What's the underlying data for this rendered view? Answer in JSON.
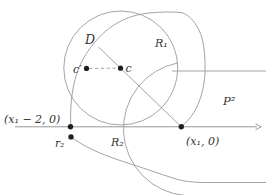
{
  "figure": {
    "width": 276,
    "height": 195,
    "colors": {
      "background": "#ffffff",
      "curve_stroke": "#9a9a9a",
      "axis_stroke": "#8c8c8c",
      "dot_fill": "#1f1f1f",
      "label_color": "#333333"
    },
    "axis": {
      "name": "real-axis",
      "x1": 15,
      "y": 126.8,
      "x2": 257,
      "arrow": "M255.5,123.9 L261.2,126.8 L255.5,129.8"
    },
    "circles": [
      {
        "name": "disk-D-boundary",
        "cx": 120.8,
        "cy": 68,
        "r": 57
      }
    ],
    "paths": [
      {
        "name": "outer-oval-R1-boundary",
        "d": "M70.8,126 C70,108 71.5,92 76,76 C81,59.5 90.5,45.5 102.5,34 C115,22 131,14.8 149,13 C160,11.9 172,11.6 182,12.6 C191.5,16 198.8,26.5 202.3,39 C204.6,48.5 205.3,60 205,71.5 C204.6,86 200.8,101 194.3,111.8 C190,118.6 186,122.8 181.3,126.8"
      },
      {
        "name": "circle-through-axis-arc",
        "d": "M177.8,62.9 A67,67 0 0 0 185.5,195.5"
      },
      {
        "name": "P2-lower-boundary",
        "d": "M71,136.9 C84,146.5 99,153.5 120,160.5 C142,167.5 160,174 176,179 C188,182.3 197,182.5 210,182.5 L266,182.5"
      }
    ],
    "lines": [
      {
        "name": "radius-segment-to-x1",
        "x1": 98.5,
        "y1": 47,
        "x2": 181.3,
        "y2": 126.8,
        "dashed": false
      },
      {
        "name": "P2-upper-boundary-line",
        "x1": 172,
        "y1": 71,
        "x2": 266,
        "y2": 71,
        "dashed": false
      },
      {
        "name": "c-cprime-dashed-segment",
        "x1": 89.3,
        "y1": 68.4,
        "x2": 117.8,
        "y2": 68.2,
        "dashed": true
      }
    ],
    "points": [
      {
        "name": "point-x1-minus-2",
        "x": 70.5,
        "y": 126.8,
        "r": 2.7
      },
      {
        "name": "point-x1",
        "x": 181.3,
        "y": 126.8,
        "r": 2.7
      },
      {
        "name": "point-r2",
        "x": 71,
        "y": 136.9,
        "r": 2.7
      },
      {
        "name": "point-c",
        "x": 120.5,
        "y": 68.2,
        "r": 2.6
      },
      {
        "name": "point-c-prime",
        "x": 86.5,
        "y": 68.4,
        "r": 2.6
      }
    ],
    "labels": [
      {
        "name": "label-disk-D",
        "text": "D",
        "x": 85,
        "y": 43.5,
        "size": 12.5
      },
      {
        "name": "label-region-R1",
        "text": "R₁",
        "x": 155,
        "y": 47,
        "size": 11
      },
      {
        "name": "label-point-c",
        "text": "c",
        "x": 125.5,
        "y": 72.3,
        "size": 11
      },
      {
        "name": "label-point-c-prime",
        "text": "c′",
        "x": 73,
        "y": 72.5,
        "size": 11
      },
      {
        "name": "label-region-P2",
        "text": "P²",
        "x": 223,
        "y": 105,
        "size": 11.5
      },
      {
        "name": "label-coord-x1-minus-2",
        "text": "(x₁ − 2, 0)",
        "x": 4,
        "y": 123,
        "size": 11
      },
      {
        "name": "label-coord-x1",
        "text": "(x₁, 0)",
        "x": 186,
        "y": 144.5,
        "size": 11
      },
      {
        "name": "label-point-r2",
        "text": "r₂",
        "x": 55,
        "y": 146.5,
        "size": 10.5
      },
      {
        "name": "label-region-R2",
        "text": "R₂",
        "x": 111,
        "y": 146.3,
        "size": 11
      }
    ]
  }
}
